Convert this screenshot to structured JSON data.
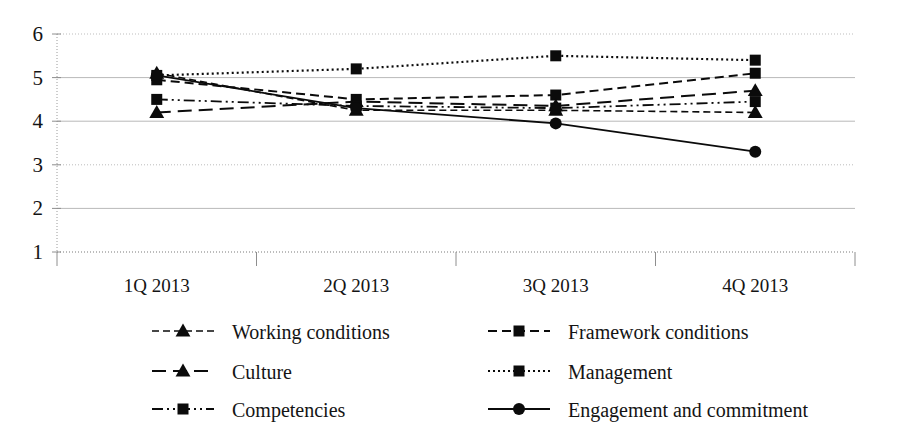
{
  "chart_data": {
    "type": "line",
    "title": "",
    "subtitle": "",
    "xlabel": "",
    "ylabel": "",
    "categories": [
      "1Q 2013",
      "2Q 2013",
      "3Q 2013",
      "4Q 2013"
    ],
    "ylim": [
      1,
      6
    ],
    "yticks": [
      1,
      2,
      3,
      4,
      5,
      6
    ],
    "ytick_labels": [
      "1",
      "2",
      "3",
      "4",
      "5",
      "6"
    ],
    "grid": true,
    "grid_axis": "y",
    "legend_position": "bottom",
    "legend_columns": 2,
    "series": [
      {
        "name": "Working conditions",
        "values": [
          5.1,
          4.25,
          4.25,
          4.2
        ],
        "marker": "triangle",
        "line_style": "dashed",
        "dasharray": "7 4",
        "line_width": 1.6,
        "color": "#0b0b0b"
      },
      {
        "name": "Framework conditions",
        "values": [
          4.95,
          4.5,
          4.6,
          5.1
        ],
        "marker": "square",
        "line_style": "dashed",
        "dasharray": "9 5",
        "line_width": 2.0,
        "color": "#0b0b0b"
      },
      {
        "name": "Culture",
        "values": [
          4.2,
          4.45,
          4.35,
          4.7
        ],
        "marker": "triangle",
        "line_style": "long-dash",
        "dasharray": "14 7",
        "line_width": 2.0,
        "color": "#0b0b0b"
      },
      {
        "name": "Management",
        "values": [
          5.05,
          5.2,
          5.5,
          5.4
        ],
        "marker": "square",
        "line_style": "dotted",
        "dasharray": "2 3",
        "line_width": 2.2,
        "color": "#0b0b0b"
      },
      {
        "name": "Competencies",
        "values": [
          4.5,
          4.35,
          4.3,
          4.45
        ],
        "marker": "square",
        "line_style": "dash-dot-dot",
        "dasharray": "11 4 2 4 2 4",
        "line_width": 1.8,
        "color": "#0b0b0b"
      },
      {
        "name": "Engagement and commitment",
        "values": [
          5.05,
          4.3,
          3.95,
          3.3
        ],
        "marker": "circle",
        "line_style": "solid",
        "dasharray": "",
        "line_width": 1.8,
        "color": "#0b0b0b"
      }
    ]
  },
  "legend": {
    "entries": [
      {
        "label": "Working conditions",
        "marker": "triangle",
        "dasharray": "7 4"
      },
      {
        "label": "Framework conditions",
        "marker": "square",
        "dasharray": "9 5"
      },
      {
        "label": "Culture",
        "marker": "triangle",
        "dasharray": "14 7"
      },
      {
        "label": "Management",
        "marker": "square",
        "dasharray": "2 3"
      },
      {
        "label": "Competencies",
        "marker": "square",
        "dasharray": "11 4 2 4 2 4"
      },
      {
        "label": "Engagement and commitment",
        "marker": "circle",
        "dasharray": ""
      }
    ]
  },
  "colors": {
    "ink": "#0b0b0b",
    "grid": "#b9b9b9",
    "axis": "#8e8e8e",
    "background": "#ffffff"
  }
}
